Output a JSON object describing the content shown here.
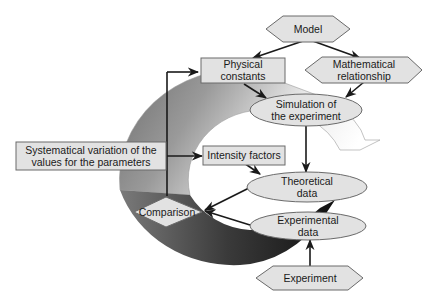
{
  "diagram": {
    "type": "flowchart-cycle",
    "nodes": {
      "model": {
        "label": "Model",
        "shape": "hexagon"
      },
      "physical_constants": {
        "line1": "Physical",
        "line2": "constants",
        "shape": "rectangle"
      },
      "mathematical_relationship": {
        "line1": "Mathematical",
        "line2": "relationship",
        "shape": "hexagon"
      },
      "simulation": {
        "line1": "Simulation of",
        "line2": "the experiment",
        "shape": "ellipse"
      },
      "systematical_variation": {
        "line1": "Systematical variation of the",
        "line2": "values for the parameters",
        "shape": "rectangle"
      },
      "intensity_factors": {
        "label": "Intensity factors",
        "shape": "rectangle"
      },
      "theoretical_data": {
        "line1": "Theoretical",
        "line2": "data",
        "shape": "ellipse"
      },
      "comparison": {
        "label": "Comparison",
        "shape": "diamond"
      },
      "experimental_data": {
        "line1": "Experimental",
        "line2": "data",
        "shape": "ellipse"
      },
      "experiment": {
        "label": "Experiment",
        "shape": "hexagon"
      }
    },
    "edges": [
      {
        "from": "Model",
        "to": "Physical constants"
      },
      {
        "from": "Model",
        "to": "Mathematical relationship"
      },
      {
        "from": "Physical constants",
        "to": "Simulation of the experiment"
      },
      {
        "from": "Mathematical relationship",
        "to": "Simulation of the experiment"
      },
      {
        "from": "Simulation of the experiment",
        "to": "Theoretical data"
      },
      {
        "from": "Intensity factors",
        "to": "Theoretical data"
      },
      {
        "from": "Theoretical data",
        "to": "Comparison"
      },
      {
        "from": "Experimental data",
        "to": "Comparison"
      },
      {
        "from": "Experiment",
        "to": "Experimental data"
      },
      {
        "from": "Comparison",
        "to": "Physical constants"
      },
      {
        "from": "Comparison",
        "to": "Intensity factors"
      }
    ],
    "colors": {
      "node_fill": "#e2e2e2",
      "node_stroke": "#6a6a6a",
      "ring_dark": "#1e1e1e",
      "ring_light": "#f2f2f2"
    }
  }
}
